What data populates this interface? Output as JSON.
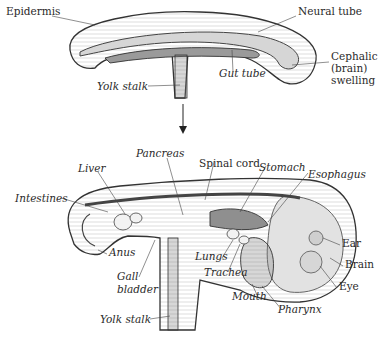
{
  "diagram": {
    "top_panel": {
      "labels": [
        {
          "id": "epidermis",
          "text": "Epidermis",
          "italic": false,
          "x": 6,
          "y": 11
        },
        {
          "id": "neural-tube",
          "text": "Neural tube",
          "italic": false,
          "x": 298,
          "y": 11
        },
        {
          "id": "cephalic-1",
          "text": "Cephalic",
          "italic": false,
          "x": 331,
          "y": 56
        },
        {
          "id": "cephalic-2",
          "text": "(brain)",
          "italic": false,
          "x": 331,
          "y": 68
        },
        {
          "id": "cephalic-3",
          "text": "swelling",
          "italic": false,
          "x": 331,
          "y": 80
        },
        {
          "id": "gut-tube",
          "text": "Gut tube",
          "italic": true,
          "x": 219,
          "y": 73
        },
        {
          "id": "yolk-stalk-top",
          "text": "Yolk stalk",
          "italic": true,
          "x": 97,
          "y": 83
        }
      ]
    },
    "arrow": {
      "direction": "down"
    },
    "bottom_panel": {
      "labels": [
        {
          "id": "pancreas",
          "text": "Pancreas",
          "italic": true,
          "x": 136,
          "y": 146
        },
        {
          "id": "spinal-cord",
          "text": "Spinal cord",
          "italic": false,
          "x": 199,
          "y": 157
        },
        {
          "id": "stomach",
          "text": "Stomach",
          "italic": true,
          "x": 259,
          "y": 160
        },
        {
          "id": "esophagus",
          "text": "Esophagus",
          "italic": true,
          "x": 308,
          "y": 168
        },
        {
          "id": "liver",
          "text": "Liver",
          "italic": true,
          "x": 78,
          "y": 160
        },
        {
          "id": "intestines",
          "text": "Intestines",
          "italic": true,
          "x": 15,
          "y": 191
        },
        {
          "id": "ear",
          "text": "Ear",
          "italic": false,
          "x": 342,
          "y": 239
        },
        {
          "id": "brain",
          "text": "Brain",
          "italic": false,
          "x": 345,
          "y": 260
        },
        {
          "id": "eye",
          "text": "Eye",
          "italic": false,
          "x": 339,
          "y": 282
        },
        {
          "id": "anus",
          "text": "Anus",
          "italic": true,
          "x": 109,
          "y": 249
        },
        {
          "id": "lungs",
          "text": "Lungs",
          "italic": true,
          "x": 195,
          "y": 252
        },
        {
          "id": "trachea",
          "text": "Trachea",
          "italic": true,
          "x": 204,
          "y": 268
        },
        {
          "id": "gall-1",
          "text": "Gall",
          "italic": true,
          "x": 117,
          "y": 270
        },
        {
          "id": "gall-2",
          "text": "bladder",
          "italic": true,
          "x": 117,
          "y": 283
        },
        {
          "id": "mouth",
          "text": "Mouth",
          "italic": true,
          "x": 232,
          "y": 293
        },
        {
          "id": "pharynx",
          "text": "Pharynx",
          "italic": true,
          "x": 278,
          "y": 306
        },
        {
          "id": "yolk-stalk-bottom",
          "text": "Yolk stalk",
          "italic": true,
          "x": 100,
          "y": 314
        }
      ]
    }
  }
}
